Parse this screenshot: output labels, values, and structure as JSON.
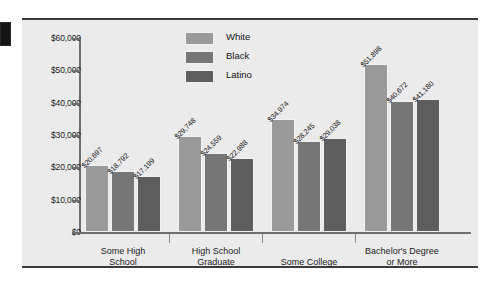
{
  "chart_data": {
    "type": "bar",
    "title": "",
    "xlabel": "",
    "ylabel": "",
    "ylim": [
      0,
      60000
    ],
    "grid": false,
    "legend_position": "top-center",
    "ytick_labels": [
      "$60,000",
      "$50,000",
      "$40,000",
      "$30,000",
      "$20,000",
      "$10,000",
      "$0"
    ],
    "ytick_values": [
      60000,
      50000,
      40000,
      30000,
      20000,
      10000,
      0
    ],
    "categories": [
      "Some High\nSchool",
      "High School\nGraduate",
      "Some College",
      "Bachelor's Degree\nor More"
    ],
    "series": [
      {
        "name": "White",
        "color": "#9a9a9a",
        "values": [
          20697,
          29748,
          34974,
          51898
        ],
        "labels": [
          "$20,697",
          "$29,748",
          "$34,974",
          "$51,898"
        ]
      },
      {
        "name": "Black",
        "color": "#767676",
        "values": [
          18792,
          24559,
          28245,
          40672
        ],
        "labels": [
          "$18,792",
          "$24,559",
          "$28,245",
          "$40,672"
        ]
      },
      {
        "name": "Latino",
        "color": "#5e5e5e",
        "values": [
          17199,
          22988,
          29038,
          41180
        ],
        "labels": [
          "$17,199",
          "$22,988",
          "$29,038",
          "$41,180"
        ]
      }
    ]
  },
  "legend": {
    "items": [
      {
        "label": "White"
      },
      {
        "label": "Black"
      },
      {
        "label": "Latino"
      }
    ]
  }
}
